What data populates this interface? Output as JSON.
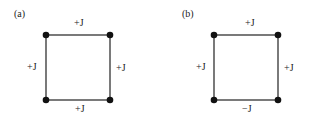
{
  "panels": [
    {
      "label": "(a)",
      "bonds": {
        "top": "+J",
        "left": "+J",
        "right": "+J",
        "bottom": "+J"
      }
    },
    {
      "label": "(b)",
      "bonds": {
        "top": "+J",
        "left": "+J",
        "right": "+J",
        "bottom": "−J"
      }
    }
  ]
}
